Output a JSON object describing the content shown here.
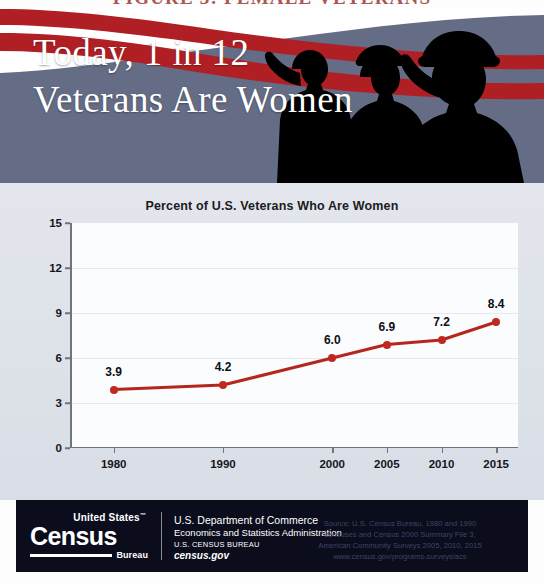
{
  "cut_title": "FIGURE 3: FEMALE VETERANS",
  "banner": {
    "headline_line1": "Today, 1 in 12",
    "headline_line2": "Veterans Are Women",
    "background_color": "#656d86",
    "stripe_color": "#b01f24",
    "silhouette_color": "#000000"
  },
  "chart_data": {
    "type": "line",
    "title": "Percent of U.S. Veterans Who Are Women",
    "xlabel": "",
    "ylabel": "",
    "categories": [
      "1980",
      "1990",
      "2000",
      "2005",
      "2010",
      "2015"
    ],
    "x_positions": [
      1980,
      1990,
      2000,
      2005,
      2010,
      2015
    ],
    "values": [
      3.9,
      4.2,
      6.0,
      6.9,
      7.2,
      8.4
    ],
    "data_labels": [
      "3.9",
      "4.2",
      "6.0",
      "6.9",
      "7.2",
      "8.4"
    ],
    "yticks": [
      0,
      3,
      6,
      9,
      12,
      15
    ],
    "ytick_labels": [
      "0",
      "3",
      "6",
      "9",
      "12",
      "15"
    ],
    "ylim": [
      0,
      15
    ],
    "xlim": [
      1976,
      2017
    ],
    "grid": "faint-horizontal",
    "legend": "none",
    "line_color": "#b5271d",
    "marker_color": "#c1281f"
  },
  "footer": {
    "logo": {
      "united_states": "United States",
      "trademark": "™",
      "census": "Census",
      "bureau": "Bureau"
    },
    "department": {
      "line1": "U.S. Department of Commerce",
      "line2": "Economics and Statistics Administration",
      "line3": "U.S. CENSUS BUREAU",
      "line4": "census.gov"
    },
    "source": {
      "line1": "Source: U.S. Census Bureau, 1980 and 1990",
      "line2": "censuses and Census 2000 Summary File 3,",
      "line3": "American Community Surveys 2005, 2010, 2015",
      "line4": "www.census.gov/programs-surveys/acs"
    },
    "background_color": "#0b0d1c"
  }
}
